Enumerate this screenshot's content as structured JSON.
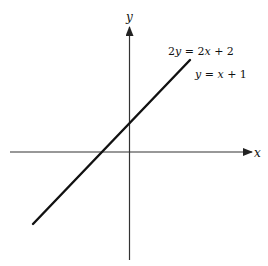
{
  "diagram": {
    "type": "coordinate-plane-line",
    "axes": {
      "x_label": "x",
      "y_label": "y"
    },
    "line": {
      "equation_1": {
        "coef": "2",
        "var_y": "y",
        "eq": " = 2",
        "var_x": "x",
        "rest": " + 2"
      },
      "equation_2": {
        "var_y": "y",
        "eq": " = ",
        "var_x": "x",
        "rest": " + 1"
      },
      "equation_1_text": "2y = 2x + 2",
      "equation_2_text": "y = x + 1",
      "slope": 1,
      "y_intercept": 1,
      "x_intercept": -1
    },
    "colors": {
      "line": "#111111",
      "axes": "#333333",
      "background": "#ffffff"
    }
  }
}
